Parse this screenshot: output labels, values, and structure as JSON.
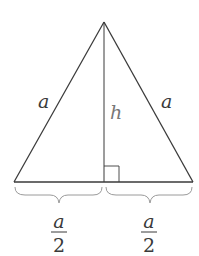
{
  "diagram": {
    "type": "equilateral-triangle-altitude",
    "labels": {
      "left_side": "a",
      "right_side": "a",
      "height": "h",
      "left_half": {
        "numerator": "a",
        "denominator": "2"
      },
      "right_half": {
        "numerator": "a",
        "denominator": "2"
      }
    },
    "colors": {
      "stroke": "#3a3a3a",
      "brace": "#9a9a9a",
      "text": "#3a3a3a",
      "background": "#ffffff"
    }
  }
}
